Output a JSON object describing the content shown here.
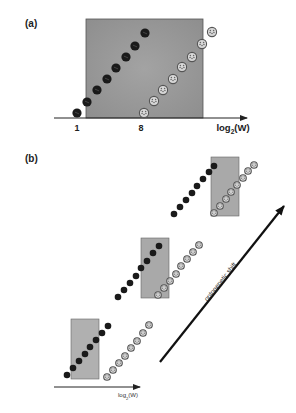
{
  "figure": {
    "panel_a": {
      "label": "(a)",
      "label_pos": [
        25,
        27
      ],
      "box": {
        "x": 86,
        "y": 19,
        "w": 117,
        "h": 99,
        "fill": "#9a9a9a"
      },
      "axis": {
        "x1": 54,
        "x2": 247,
        "y": 118
      },
      "axis_label": {
        "text_pre": "log",
        "sub": "2",
        "text_post": "(W)",
        "x": 233,
        "y": 131
      },
      "ticks": [
        {
          "label": "1",
          "x": 77,
          "y": 131
        },
        {
          "label": "8",
          "x": 141,
          "y": 131
        }
      ],
      "dot_radius": 4.6,
      "dark_series": [
        [
          77,
          113
        ],
        [
          87,
          102
        ],
        [
          97,
          90
        ],
        [
          107,
          79
        ],
        [
          116,
          68
        ],
        [
          126,
          57
        ],
        [
          135,
          46
        ],
        [
          145,
          33
        ]
      ],
      "light_series": [
        [
          144,
          113
        ],
        [
          154,
          101
        ],
        [
          163,
          90
        ],
        [
          173,
          79
        ],
        [
          182,
          67
        ],
        [
          192,
          57
        ],
        [
          202,
          44
        ],
        [
          212,
          32
        ]
      ]
    },
    "panel_b": {
      "label": "(b)",
      "label_pos": [
        25,
        162
      ],
      "dot_radius": 3.3,
      "groups": [
        {
          "name": "top",
          "box": {
            "x": 211,
            "y": 157,
            "w": 28,
            "h": 59,
            "fill": "#a9a9a9"
          },
          "dark_series": [
            [
              174,
              214
            ],
            [
              180,
              207
            ],
            [
              186,
              200
            ],
            [
              192,
              193
            ],
            [
              197,
              186
            ],
            [
              203,
              179
            ],
            [
              209,
              172
            ],
            [
              214,
              166
            ]
          ],
          "light_series": [
            [
              214,
              213
            ],
            [
              220,
              206
            ],
            [
              226,
              199
            ],
            [
              231,
              192
            ],
            [
              237,
              185
            ],
            [
              243,
              178
            ],
            [
              248,
              171
            ],
            [
              254,
              165
            ]
          ]
        },
        {
          "name": "middle",
          "box": {
            "x": 141,
            "y": 238,
            "w": 28,
            "h": 60,
            "fill": "#a9a9a9"
          },
          "dark_series": [
            [
              118,
              297
            ],
            [
              124,
              290
            ],
            [
              130,
              283
            ],
            [
              136,
              276
            ],
            [
              141,
              268
            ],
            [
              147,
              261
            ],
            [
              153,
              253
            ],
            [
              159,
              246
            ]
          ],
          "light_series": [
            [
              158,
              295
            ],
            [
              164,
              288
            ],
            [
              170,
              281
            ],
            [
              176,
              274
            ],
            [
              181,
              266
            ],
            [
              187,
              259
            ],
            [
              193,
              252
            ],
            [
              199,
              245
            ]
          ]
        },
        {
          "name": "bottom",
          "box": {
            "x": 71,
            "y": 319,
            "w": 28,
            "h": 60,
            "fill": "#b0b0b0"
          },
          "dark_series": [
            [
              67,
              375
            ],
            [
              73,
              368
            ],
            [
              79,
              361
            ],
            [
              85,
              354
            ],
            [
              90,
              347
            ],
            [
              96,
              340
            ],
            [
              102,
              333
            ],
            [
              108,
              326
            ]
          ],
          "light_series": [
            [
              107,
              377
            ],
            [
              113,
              370
            ],
            [
              119,
              363
            ],
            [
              125,
              356
            ],
            [
              131,
              348
            ],
            [
              137,
              341
            ],
            [
              143,
              333
            ],
            [
              149,
              325
            ]
          ]
        }
      ],
      "axis": {
        "x1": 54,
        "x2": 140,
        "y": 387
      },
      "axis_label": {
        "text_pre": "log",
        "sub": "2",
        "text_post": "(W)",
        "x": 128,
        "y": 397
      },
      "shift_arrow": {
        "x1": 160,
        "y1": 362,
        "x2": 284,
        "y2": 206
      },
      "shift_label": "ontogenetic shift",
      "shift_label_pos": [
        222,
        283
      ],
      "shift_label_angle": -51.5
    },
    "colors": {
      "dark_dot": "#1a1a1a",
      "light_dot": "#d8d8d8",
      "light_dot_stroke": "#555555",
      "axis": "#222222",
      "arrow": "#111111"
    }
  }
}
